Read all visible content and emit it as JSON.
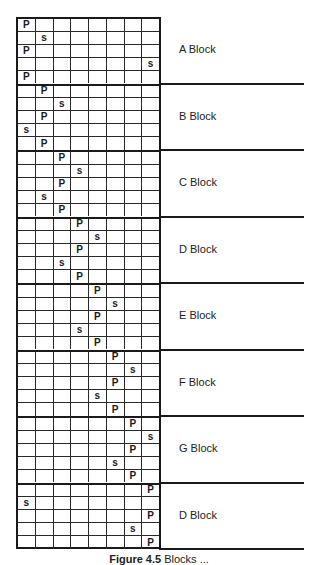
{
  "figure": {
    "columns": 8,
    "rows_per_block": 5,
    "blocks": [
      {
        "label": "A Block",
        "rows": [
          [
            "P",
            "",
            "",
            "",
            "",
            "",
            "",
            ""
          ],
          [
            "",
            "s",
            "",
            "",
            "",
            "",
            "",
            ""
          ],
          [
            "P",
            "",
            "",
            "",
            "",
            "",
            "",
            ""
          ],
          [
            "",
            "",
            "",
            "",
            "",
            "",
            "",
            "s"
          ],
          [
            "P",
            "",
            "",
            "",
            "",
            "",
            "",
            ""
          ]
        ]
      },
      {
        "label": "B Block",
        "rows": [
          [
            "",
            "P",
            "",
            "",
            "",
            "",
            "",
            ""
          ],
          [
            "",
            "",
            "s",
            "",
            "",
            "",
            "",
            ""
          ],
          [
            "",
            "P",
            "",
            "",
            "",
            "",
            "",
            ""
          ],
          [
            "s",
            "",
            "",
            "",
            "",
            "",
            "",
            ""
          ],
          [
            "",
            "P",
            "",
            "",
            "",
            "",
            "",
            ""
          ]
        ]
      },
      {
        "label": "C Block",
        "rows": [
          [
            "",
            "",
            "P",
            "",
            "",
            "",
            "",
            ""
          ],
          [
            "",
            "",
            "",
            "s",
            "",
            "",
            "",
            ""
          ],
          [
            "",
            "",
            "P",
            "",
            "",
            "",
            "",
            ""
          ],
          [
            "",
            "s",
            "",
            "",
            "",
            "",
            "",
            ""
          ],
          [
            "",
            "",
            "P",
            "",
            "",
            "",
            "",
            ""
          ]
        ]
      },
      {
        "label": "D Block",
        "rows": [
          [
            "",
            "",
            "",
            "P",
            "",
            "",
            "",
            ""
          ],
          [
            "",
            "",
            "",
            "",
            "s",
            "",
            "",
            ""
          ],
          [
            "",
            "",
            "",
            "P",
            "",
            "",
            "",
            ""
          ],
          [
            "",
            "",
            "s",
            "",
            "",
            "",
            "",
            ""
          ],
          [
            "",
            "",
            "",
            "P",
            "",
            "",
            "",
            ""
          ]
        ]
      },
      {
        "label": "E Block",
        "rows": [
          [
            "",
            "",
            "",
            "",
            "P",
            "",
            "",
            ""
          ],
          [
            "",
            "",
            "",
            "",
            "",
            "s",
            "",
            ""
          ],
          [
            "",
            "",
            "",
            "",
            "P",
            "",
            "",
            ""
          ],
          [
            "",
            "",
            "",
            "s",
            "",
            "",
            "",
            ""
          ],
          [
            "",
            "",
            "",
            "",
            "P",
            "",
            "",
            ""
          ]
        ]
      },
      {
        "label": "F Block",
        "rows": [
          [
            "",
            "",
            "",
            "",
            "",
            "P",
            "",
            ""
          ],
          [
            "",
            "",
            "",
            "",
            "",
            "",
            "s",
            ""
          ],
          [
            "",
            "",
            "",
            "",
            "",
            "P",
            "",
            ""
          ],
          [
            "",
            "",
            "",
            "",
            "s",
            "",
            "",
            ""
          ],
          [
            "",
            "",
            "",
            "",
            "",
            "P",
            "",
            ""
          ]
        ]
      },
      {
        "label": "G Block",
        "rows": [
          [
            "",
            "",
            "",
            "",
            "",
            "",
            "P",
            ""
          ],
          [
            "",
            "",
            "",
            "",
            "",
            "",
            "",
            "s"
          ],
          [
            "",
            "",
            "",
            "",
            "",
            "",
            "P",
            ""
          ],
          [
            "",
            "",
            "",
            "",
            "",
            "s",
            "",
            ""
          ],
          [
            "",
            "",
            "",
            "",
            "",
            "",
            "P",
            ""
          ]
        ]
      },
      {
        "label": "D Block",
        "rows": [
          [
            "",
            "",
            "",
            "",
            "",
            "",
            "",
            "P"
          ],
          [
            "s",
            "",
            "",
            "",
            "",
            "",
            "",
            ""
          ],
          [
            "",
            "",
            "",
            "",
            "",
            "",
            "",
            "P"
          ],
          [
            "",
            "",
            "",
            "",
            "",
            "",
            "s",
            ""
          ],
          [
            "",
            "",
            "",
            "",
            "",
            "",
            "",
            "P"
          ]
        ]
      }
    ],
    "caption_prefix": "Figure 4.5",
    "caption_text": " Blocks ..."
  }
}
